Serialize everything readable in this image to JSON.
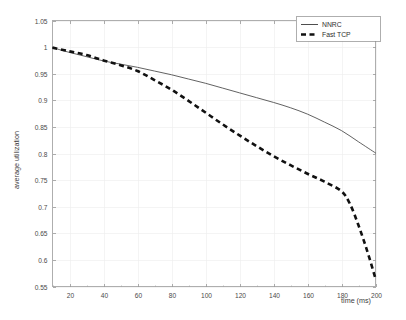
{
  "chart_data": {
    "type": "line",
    "title": "",
    "xlabel": "time (ms)",
    "ylabel": "average utilization",
    "xlim": [
      10,
      200
    ],
    "ylim": [
      0.55,
      1.05
    ],
    "xticks": [
      20,
      40,
      60,
      80,
      100,
      120,
      140,
      160,
      180,
      200
    ],
    "xtick_labels": [
      "20",
      "40",
      "60",
      "80",
      "100",
      "120",
      "140",
      "160",
      "180",
      "200"
    ],
    "yticks": [
      0.55,
      0.6,
      0.65,
      0.7,
      0.75,
      0.8,
      0.85,
      0.9,
      0.95,
      1,
      1.05
    ],
    "ytick_labels": [
      "0.55",
      "0.6",
      "0.65",
      "0.7",
      "0.75",
      "0.8",
      "0.85",
      "0.9",
      "0.95",
      "1",
      "1.05"
    ],
    "grid": true,
    "legend_position": "top-right",
    "series": [
      {
        "name": "NNRC",
        "style": "solid",
        "color": "#3a3a3a",
        "width": 0.8,
        "x": [
          10,
          20,
          30,
          40,
          50,
          60,
          70,
          80,
          90,
          100,
          110,
          120,
          130,
          140,
          150,
          160,
          170,
          180,
          190,
          200
        ],
        "y": [
          0.999,
          0.99,
          0.982,
          0.974,
          0.968,
          0.962,
          0.955,
          0.948,
          0.94,
          0.932,
          0.923,
          0.914,
          0.905,
          0.896,
          0.886,
          0.874,
          0.859,
          0.843,
          0.822,
          0.801
        ]
      },
      {
        "name": "Fast TCP",
        "style": "dashed",
        "color": "#111111",
        "width": 2.6,
        "x": [
          10,
          20,
          30,
          40,
          50,
          60,
          70,
          80,
          90,
          100,
          110,
          120,
          130,
          140,
          150,
          160,
          170,
          180,
          185,
          190,
          195,
          200
        ],
        "y": [
          0.999,
          0.992,
          0.985,
          0.975,
          0.966,
          0.955,
          0.938,
          0.92,
          0.899,
          0.877,
          0.855,
          0.834,
          0.814,
          0.795,
          0.778,
          0.762,
          0.747,
          0.729,
          0.705,
          0.665,
          0.618,
          0.565
        ]
      }
    ]
  },
  "legend": {
    "entries": [
      {
        "label": "NNRC"
      },
      {
        "label": "Fast TCP"
      }
    ]
  },
  "axes": {
    "x_title": "time (ms)",
    "y_title": "average utilization"
  }
}
